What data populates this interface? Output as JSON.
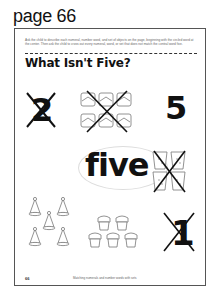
{
  "page_label": "page 66",
  "worksheet": {
    "instructions": "Ask the child to describe each numeral, number word, and set of objects on the page, beginning with the circled word at the center. Then ask the child to cross out every numeral, word, or set that does not match the central word five.",
    "title": "What Isn't Five?",
    "center_word": "five",
    "items": [
      {
        "id": "numeral-2",
        "type": "numeral",
        "value": "2",
        "crossed_out": true
      },
      {
        "id": "cake-set",
        "type": "object-set",
        "object": "cake slices",
        "count": 6,
        "crossed_out": true
      },
      {
        "id": "numeral-5",
        "type": "numeral",
        "value": "5",
        "crossed_out": false
      },
      {
        "id": "cup-set",
        "type": "object-set",
        "object": "cups",
        "count": 4,
        "crossed_out": true
      },
      {
        "id": "party-hat-set",
        "type": "object-set",
        "object": "party hats",
        "count": 5,
        "crossed_out": false
      },
      {
        "id": "cupcake-set",
        "type": "object-set",
        "object": "cupcakes",
        "count": 5,
        "crossed_out": false
      },
      {
        "id": "numeral-1",
        "type": "numeral",
        "value": "1",
        "crossed_out": true
      }
    ],
    "footer": {
      "page_number": "66",
      "caption": "Matching numerals and number words with sets"
    }
  }
}
